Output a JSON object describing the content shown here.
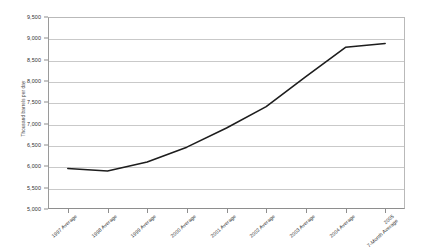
{
  "chart_data": {
    "type": "line",
    "title": "",
    "xlabel": "",
    "ylabel": "Thousand barrels per day",
    "ylim": [
      5000,
      9500
    ],
    "ytick_step": 500,
    "yticks": [
      "5,000",
      "5,500",
      "6,000",
      "6,500",
      "7,000",
      "7,500",
      "8,000",
      "8,500",
      "9,000",
      "9,500"
    ],
    "ytick_values": [
      5000,
      5500,
      6000,
      6500,
      7000,
      7500,
      8000,
      8500,
      9000,
      9500
    ],
    "grid": true,
    "legend": "none",
    "categories": [
      "1997 Average",
      "1998 Average",
      "1999 Average",
      "2000 Average",
      "2001 Average",
      "2002 Average",
      "2003 Average",
      "2004 Average",
      "2005 7-Month Average"
    ],
    "category_lines": [
      [
        "1997 Average"
      ],
      [
        "1998 Average"
      ],
      [
        "1999 Average"
      ],
      [
        "2000 Average"
      ],
      [
        "2001 Average"
      ],
      [
        "2002 Average"
      ],
      [
        "2003 Average"
      ],
      [
        "2004 Average"
      ],
      [
        "2005",
        "7-Month Average"
      ]
    ],
    "series": [
      {
        "name": "Thousand barrels per day",
        "color": "#1d1d1d",
        "values": [
          5950,
          5890,
          6100,
          6450,
          6900,
          7400,
          8100,
          8790,
          8880
        ]
      }
    ]
  },
  "style": {
    "line_color": "#1d1d1d",
    "gridline_color": "#c9c9c9",
    "axis_color": "#8e8e8e",
    "text_color": "#2f2f2f",
    "background": "#ffffff"
  }
}
